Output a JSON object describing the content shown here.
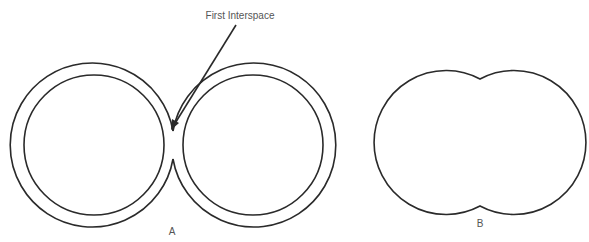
{
  "annotation": {
    "text": "First Interspace"
  },
  "figures": [
    {
      "id": "A",
      "label": "A"
    },
    {
      "id": "B",
      "label": "B"
    }
  ],
  "colors": {
    "stroke": "#2a2a2a",
    "text": "#555555",
    "background": "#ffffff"
  }
}
